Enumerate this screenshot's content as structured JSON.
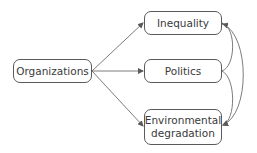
{
  "nodes": {
    "organizations": "Organizations",
    "inequality": "Inequality",
    "politics": "Politics",
    "environmental_line1": "Environmental",
    "environmental_line2": "degradation"
  },
  "edges": [
    {
      "from": "Organizations",
      "to": "Inequality"
    },
    {
      "from": "Organizations",
      "to": "Politics"
    },
    {
      "from": "Organizations",
      "to": "Environmental degradation"
    },
    {
      "from": "Politics",
      "to": "Inequality"
    },
    {
      "from": "Politics",
      "to": "Environmental degradation"
    },
    {
      "from": "Inequality",
      "to": "Environmental degradation",
      "bidirectional": true
    }
  ],
  "colors": {
    "stroke": "#5a5a5a",
    "text": "#3a3a3a"
  }
}
